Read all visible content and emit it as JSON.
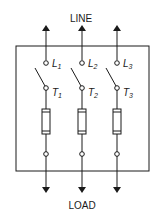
{
  "diagram": {
    "title_top": "LINE",
    "title_bottom": "LOAD",
    "line_color": "#1a1a1a",
    "poles": [
      {
        "line_label": "L",
        "line_sub": "1",
        "load_label": "T",
        "load_sub": "1"
      },
      {
        "line_label": "L",
        "line_sub": "2",
        "load_label": "T",
        "load_sub": "2"
      },
      {
        "line_label": "L",
        "line_sub": "3",
        "load_label": "T",
        "load_sub": "3"
      }
    ],
    "components": [
      "enclosure",
      "switch",
      "fuse",
      "terminal"
    ]
  }
}
